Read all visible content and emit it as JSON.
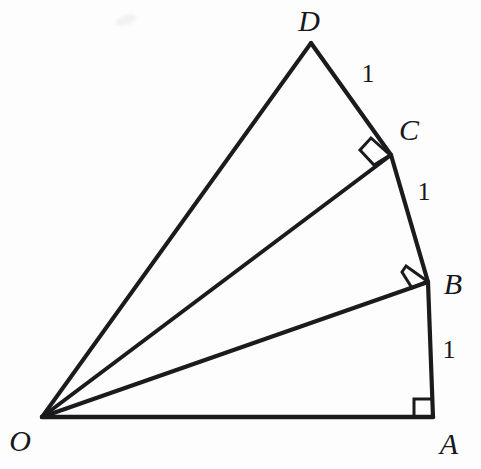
{
  "figure": {
    "kind": "geometric-diagram",
    "canvas": {
      "width": 481,
      "height": 469
    },
    "colors": {
      "background": "#fdfdfd",
      "stroke": "#1b1b1e",
      "label": "#17171a",
      "smudge": "#f1f1f3"
    },
    "stroke_widths": {
      "ray": 4.0,
      "chain": 4.2,
      "base": 4.6,
      "right_angle_mark": 3.0
    },
    "vertices": [
      {
        "name": "O",
        "label": "O",
        "x": 42,
        "y": 417,
        "label_x": 20,
        "label_y": 441
      },
      {
        "name": "A",
        "label": "A",
        "x": 433,
        "y": 417,
        "label_x": 449,
        "label_y": 444
      },
      {
        "name": "B",
        "label": "B",
        "x": 428,
        "y": 282,
        "label_x": 453,
        "label_y": 284
      },
      {
        "name": "C",
        "label": "C",
        "x": 391,
        "y": 155,
        "label_x": 409,
        "label_y": 130
      },
      {
        "name": "D",
        "label": "D",
        "x": 311,
        "y": 43,
        "label_x": 309,
        "label_y": 21
      }
    ],
    "segments": [
      {
        "name": "OA",
        "from": "O",
        "to": "A",
        "role": "base",
        "x1": 42,
        "y1": 417,
        "x2": 433,
        "y2": 417
      },
      {
        "name": "OB",
        "from": "O",
        "to": "B",
        "role": "ray",
        "x1": 42,
        "y1": 417,
        "x2": 428,
        "y2": 282
      },
      {
        "name": "OC",
        "from": "O",
        "to": "C",
        "role": "ray",
        "x1": 42,
        "y1": 417,
        "x2": 391,
        "y2": 155
      },
      {
        "name": "OD",
        "from": "O",
        "to": "D",
        "role": "ray",
        "x1": 42,
        "y1": 417,
        "x2": 311,
        "y2": 43
      },
      {
        "name": "AB",
        "from": "A",
        "to": "B",
        "role": "chain",
        "x1": 433,
        "y1": 417,
        "x2": 428,
        "y2": 282
      },
      {
        "name": "BC",
        "from": "B",
        "to": "C",
        "role": "chain",
        "x1": 428,
        "y1": 282,
        "x2": 391,
        "y2": 155
      },
      {
        "name": "CD",
        "from": "C",
        "to": "D",
        "role": "chain",
        "x1": 391,
        "y1": 155,
        "x2": 311,
        "y2": 43
      }
    ],
    "length_labels": [
      {
        "name": "length-ab",
        "text": "1",
        "segment": "AB",
        "x": 449,
        "y": 350
      },
      {
        "name": "length-bc",
        "text": "1",
        "segment": "BC",
        "x": 424,
        "y": 192
      },
      {
        "name": "length-cd",
        "text": "1",
        "segment": "CD",
        "x": 368,
        "y": 74
      }
    ],
    "right_angles": [
      {
        "name": "right-angle-a",
        "at": "A",
        "between": [
          "AO",
          "AB"
        ],
        "points": "414,417 414,399 432,399 432,417",
        "style": "axis-aligned-square"
      },
      {
        "name": "right-angle-b",
        "at": "B",
        "between": [
          "BO",
          "BC"
        ],
        "points": "406,266 427,281 411,287 403,272",
        "style": "rotated-square"
      },
      {
        "name": "right-angle-c",
        "at": "C",
        "between": [
          "CO",
          "CD"
        ],
        "points": "371,139 389,155 373,164 361,150",
        "style": "rotated-square"
      }
    ],
    "artifacts": [
      {
        "name": "scan-smudge",
        "x": 126,
        "y": 20
      }
    ]
  }
}
